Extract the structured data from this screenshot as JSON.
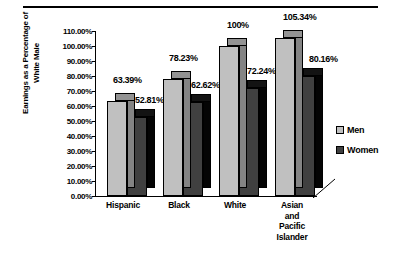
{
  "chart_data": {
    "type": "bar",
    "title": "",
    "subtitle": "",
    "xlabel": "",
    "ylabel": "Earnings as a Percentage of White Male",
    "ylabel_lines": [
      "Earnings as a Percentage of",
      "White Male"
    ],
    "ylim": [
      0,
      110
    ],
    "ytick_labels": [
      "110.00%",
      "100.00%",
      "90.00%",
      "80.00%",
      "70.00%",
      "60.00%",
      "50.00%",
      "40.00%",
      "30.00%",
      "20.00%",
      "10.00%",
      "0.00%"
    ],
    "ytick_values": [
      110,
      100,
      90,
      80,
      70,
      60,
      50,
      40,
      30,
      20,
      10,
      0
    ],
    "grid": false,
    "legend_position": "right",
    "style": "3d-clustered-column",
    "categories": [
      "Hispanic",
      "Black",
      "White",
      "Asian and Pacific Islander"
    ],
    "category_label_lines": [
      [
        "Hispanic"
      ],
      [
        "Black"
      ],
      [
        "White"
      ],
      [
        "Asian",
        "and",
        "Pacific",
        "Islander"
      ]
    ],
    "series": [
      {
        "name": "Men",
        "color": "#c0c0c0",
        "values": [
          63.39,
          78.23,
          100,
          105.34
        ],
        "labels": [
          "63.39%",
          "78.23%",
          "100%",
          "105.34%"
        ]
      },
      {
        "name": "Women",
        "color": "#404040",
        "values": [
          52.81,
          62.62,
          72.24,
          80.16
        ],
        "labels": [
          "52.81%",
          "62.62%",
          "72.24%",
          "80.16%"
        ]
      }
    ]
  },
  "legend": {
    "items": [
      {
        "label": "Men",
        "color": "#c0c0c0"
      },
      {
        "label": "Women",
        "color": "#404040"
      }
    ]
  },
  "colors": {
    "men": "#c0c0c0",
    "women": "#404040",
    "men_top": "#8a8a8a",
    "women_top": "#2a2a2a",
    "axis": "#000000",
    "background": "#ffffff"
  }
}
